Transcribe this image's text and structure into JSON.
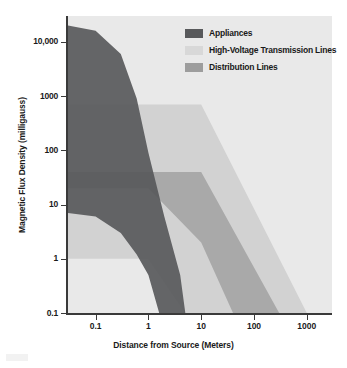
{
  "chart_data": {
    "type": "area",
    "title": "",
    "xlabel": "Distance from Source (Meters)",
    "ylabel": "Magnetic Flux Density (milligauss)",
    "xscale": "log",
    "yscale": "log",
    "xlim": [
      0.03,
      3000
    ],
    "ylim": [
      0.1,
      30000
    ],
    "grid": false,
    "legend_position": "top-right",
    "xticks": [
      "0.1",
      "1",
      "10",
      "100",
      "1000"
    ],
    "xtick_values": [
      0.1,
      1,
      10,
      100,
      1000
    ],
    "yticks": [
      "10,000",
      "1000",
      "100",
      "10",
      "1",
      "0.1"
    ],
    "ytick_values": [
      10000,
      1000,
      100,
      10,
      1,
      0.1
    ],
    "series": [
      {
        "name": "Appliances",
        "color": "#58595b",
        "upper": [
          {
            "x": 0.03,
            "y": 20000
          },
          {
            "x": 0.1,
            "y": 16000
          },
          {
            "x": 0.3,
            "y": 6000
          },
          {
            "x": 0.6,
            "y": 900
          },
          {
            "x": 1.0,
            "y": 90
          },
          {
            "x": 2.0,
            "y": 6
          },
          {
            "x": 4.0,
            "y": 0.5
          },
          {
            "x": 5.0,
            "y": 0.1
          }
        ],
        "lower": [
          {
            "x": 0.03,
            "y": 7
          },
          {
            "x": 0.1,
            "y": 6
          },
          {
            "x": 0.3,
            "y": 3
          },
          {
            "x": 0.6,
            "y": 1.2
          },
          {
            "x": 1.0,
            "y": 0.5
          },
          {
            "x": 1.6,
            "y": 0.1
          }
        ]
      },
      {
        "name": "High-Voltage Transmission Lines",
        "color": "#d2d2d2",
        "upper": [
          {
            "x": 0.03,
            "y": 700
          },
          {
            "x": 10,
            "y": 700
          },
          {
            "x": 1000,
            "y": 0.1
          },
          {
            "x": 3000,
            "y": 0.1
          }
        ],
        "lower": [
          {
            "x": 0.03,
            "y": 1
          },
          {
            "x": 1,
            "y": 1
          },
          {
            "x": 5,
            "y": 0.1
          },
          {
            "x": 3000,
            "y": 0.1
          }
        ]
      },
      {
        "name": "Distribution Lines",
        "color": "#9d9d9d",
        "upper": [
          {
            "x": 0.03,
            "y": 40
          },
          {
            "x": 10,
            "y": 40
          },
          {
            "x": 300,
            "y": 0.1
          },
          {
            "x": 800,
            "y": 0.1
          }
        ],
        "lower": [
          {
            "x": 0.03,
            "y": 20
          },
          {
            "x": 1,
            "y": 20
          },
          {
            "x": 10,
            "y": 2
          },
          {
            "x": 40,
            "y": 0.1
          },
          {
            "x": 800,
            "y": 0.1
          }
        ]
      }
    ]
  },
  "legend": {
    "items": [
      {
        "label": "Appliances",
        "color": "#58595b"
      },
      {
        "label": "High-Voltage Transmission Lines",
        "color": "#d8d8d8"
      },
      {
        "label": "Distribution Lines",
        "color": "#9d9d9d"
      }
    ]
  },
  "axes": {
    "x_title": "Distance from Source (Meters)",
    "y_title": "Magnetic Flux Density (milligauss)",
    "x_labels": [
      "0.1",
      "1",
      "10",
      "100",
      "1000"
    ],
    "y_labels": [
      "10,000",
      "1000",
      "100",
      "10",
      "1",
      "0.1"
    ]
  },
  "colors": {
    "plot_background": "#e9e9e9",
    "axis": "#3a3a3a",
    "text": "#1a1a1a"
  }
}
